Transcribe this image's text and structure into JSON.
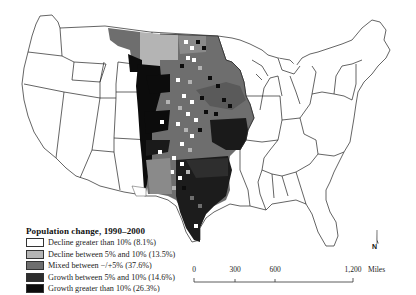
{
  "map": {
    "subject": "Great Plains counties population change, contiguous United States",
    "legend": {
      "title": "Population change, 1990–2000",
      "items": [
        {
          "label": "Decline greater than 10% (8.1%)",
          "color": "#ffffff"
        },
        {
          "label": "Decline between 5% and 10% (13.5%)",
          "color": "#b4b4b4"
        },
        {
          "label": "Mixed between −/+5% (37.6%)",
          "color": "#6e6e6e"
        },
        {
          "label": "Growth between 5% and 10% (14.6%)",
          "color": "#2e2e2e"
        },
        {
          "label": "Growth greater than 10% (26.3%)",
          "color": "#0c0c0c"
        }
      ]
    },
    "scale_bar": {
      "ticks": [
        "0",
        "300",
        "600",
        "1,200"
      ],
      "unit": "Miles"
    },
    "north_arrow": {
      "label": "N"
    }
  }
}
